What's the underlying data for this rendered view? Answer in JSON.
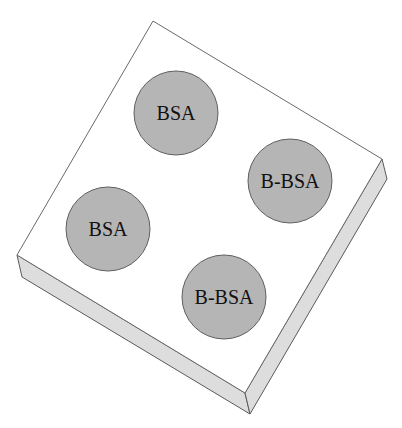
{
  "diagram": {
    "colors": {
      "background": "#ffffff",
      "plate_top": "#ffffff",
      "plate_side": "#dddddd",
      "plate_outline": "#5a5a5a",
      "spot_fill": "#b5b5b5",
      "spot_outline": "#5f5f5f",
      "label_text": "#111111"
    },
    "spots": [
      {
        "label": "BSA",
        "position": "top"
      },
      {
        "label": "B-BSA",
        "position": "right"
      },
      {
        "label": "BSA",
        "position": "left"
      },
      {
        "label": "B-BSA",
        "position": "bottom"
      }
    ]
  }
}
